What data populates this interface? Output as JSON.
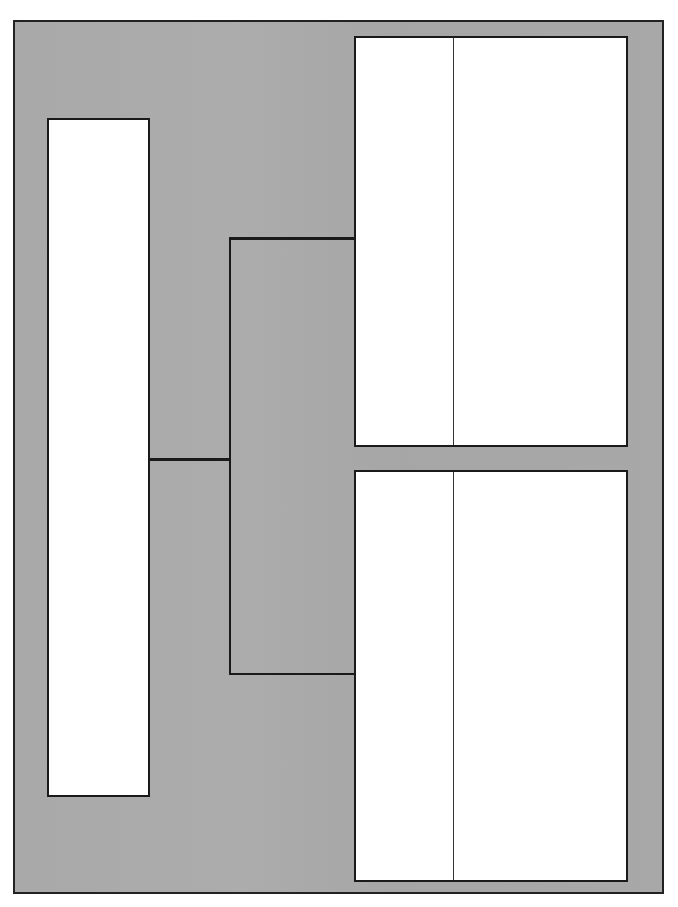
{
  "diagram": {
    "type": "bracket-tree",
    "colors": {
      "background_panel": "#a9a9a9",
      "box_fill": "#ffffff",
      "stroke": "#1a1a1a"
    },
    "nodes": [
      {
        "id": "left-box",
        "label": "",
        "columns": 1
      },
      {
        "id": "top-right-box",
        "label": "",
        "columns": 2
      },
      {
        "id": "bottom-right-box",
        "label": "",
        "columns": 2
      }
    ],
    "edges": [
      {
        "from": "left-box",
        "to": "top-right-box"
      },
      {
        "from": "left-box",
        "to": "bottom-right-box"
      }
    ]
  }
}
